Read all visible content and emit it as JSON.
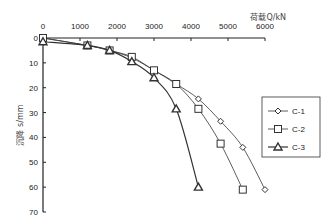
{
  "chart_data": {
    "type": "line",
    "title": "",
    "xlabel": "荷载Q/kN",
    "ylabel": "沉降 s/mm",
    "xlim": [
      0,
      6000
    ],
    "ylim": [
      0,
      70
    ],
    "y_inverted": true,
    "x_axis_position": "top",
    "xticks": [
      0,
      1000,
      2000,
      3000,
      4000,
      5000,
      6000
    ],
    "yticks": [
      0,
      10,
      20,
      30,
      40,
      50,
      60,
      70
    ],
    "grid": false,
    "legend_position": "right",
    "series": [
      {
        "name": "C-1",
        "marker": "diamond",
        "x": [
          0,
          1200,
          1800,
          2400,
          3000,
          3600,
          4200,
          4800,
          5400,
          6000
        ],
        "y": [
          0,
          3,
          5,
          8,
          13,
          18.5,
          24.5,
          33.5,
          44,
          61
        ]
      },
      {
        "name": "C-2",
        "marker": "square",
        "x": [
          0,
          1200,
          1800,
          2400,
          3000,
          3600,
          4200,
          4800,
          5400
        ],
        "y": [
          0,
          3,
          5,
          7.6,
          13,
          18.5,
          28.5,
          42.5,
          61
        ]
      },
      {
        "name": "C-3",
        "marker": "triangle",
        "x": [
          0,
          1200,
          1800,
          2400,
          3000,
          3600,
          4200
        ],
        "y": [
          1.5,
          3,
          5,
          9.5,
          16,
          28.5,
          60
        ]
      }
    ]
  }
}
